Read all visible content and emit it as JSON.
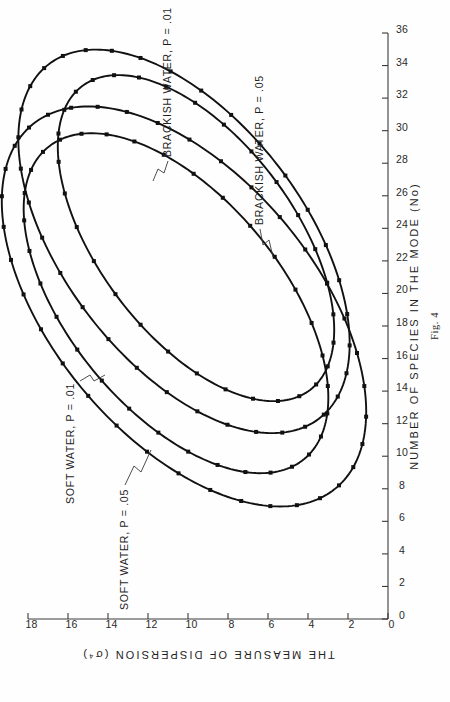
{
  "page": {
    "scan_mark_left": "",
    "scan_mark_right": "",
    "caption": "Fig. 4"
  },
  "axes": {
    "x_title": "NUMBER OF SPECIES IN THE MODE (No)",
    "y_title": "THE MEASURE OF DISPERSION (σ⁴)",
    "x_ticks": [
      "0",
      "2",
      "4",
      "6",
      "8",
      "10",
      "12",
      "14",
      "16",
      "18",
      "20",
      "22",
      "24",
      "26",
      "28",
      "30",
      "32",
      "34",
      "36"
    ],
    "y_ticks": [
      "0",
      "2",
      "4",
      "6",
      "8",
      "10",
      "12",
      "14",
      "16",
      "18"
    ],
    "x_min": 0,
    "x_max": 36,
    "x_step": 2,
    "y_min": 0,
    "y_max": 18,
    "y_step": 2
  },
  "labels": {
    "soft_05": "SOFT WATER, P = .05",
    "soft_01": "SOFT WATER, P = .01",
    "brackish_05": "BRACKISH WATER, P = .05",
    "brackish_01": "BRACKISH WATER, P = .01"
  },
  "colors": {
    "ink": "#111111",
    "axis": "#3a3a3a",
    "paper": "#fefefe"
  },
  "chart_data": {
    "type": "scatter",
    "title": "",
    "xlabel": "NUMBER OF SPECIES IN THE MODE (No)",
    "ylabel": "THE MEASURE OF DISPERSION (σ⁴)",
    "xlim": [
      0,
      36
    ],
    "ylim": [
      0,
      18
    ],
    "grid": false,
    "legend": "inline-annotations",
    "note": "Four nested tilted confidence ellipses; vertices marked with small filled squares.",
    "series": [
      {
        "name": "SOFT WATER, P = .05",
        "kind": "confidence-ellipse",
        "center": [
          23.2,
          10.2
        ],
        "semi_major": 12.9,
        "semi_minor": 6.4,
        "rotation_deg": 28,
        "n_markers": 34
      },
      {
        "name": "SOFT WATER, P = .01",
        "kind": "confidence-ellipse",
        "center": [
          23.4,
          9.6
        ],
        "semi_major": 11.0,
        "semi_minor": 5.2,
        "rotation_deg": 28,
        "n_markers": 30
      },
      {
        "name": "BRACKISH WATER, P = .05",
        "kind": "confidence-ellipse",
        "center": [
          19.4,
          10.6
        ],
        "semi_major": 11.6,
        "semi_minor": 5.7,
        "rotation_deg": 30,
        "n_markers": 32
      },
      {
        "name": "BRACKISH WATER, P = .01",
        "kind": "confidence-ellipse",
        "center": [
          19.2,
          10.2
        ],
        "semi_major": 13.6,
        "semi_minor": 7.0,
        "rotation_deg": 30,
        "n_markers": 36
      }
    ]
  }
}
